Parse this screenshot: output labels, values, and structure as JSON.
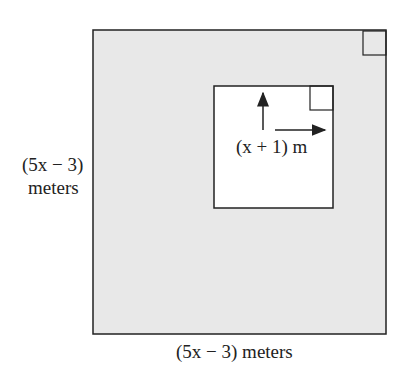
{
  "diagram": {
    "outer_square": {
      "fill": "#e8e8e8",
      "stroke": "#222222"
    },
    "inner_square": {
      "fill": "#ffffff",
      "stroke": "#222222"
    },
    "labels": {
      "left_line1": "(5x − 3)",
      "left_line2": "meters",
      "bottom": "(5x − 3) meters",
      "inner": "(x + 1) m"
    }
  }
}
